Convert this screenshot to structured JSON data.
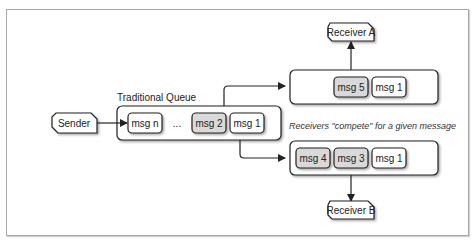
{
  "diagram": {
    "title_queue": "Traditional Queue",
    "caption": "Receivers \"compete\" for a given message",
    "sender": "Sender",
    "receiver_a": "Receiver A",
    "receiver_b": "Receiver B",
    "ellipsis": "...",
    "queue_messages": [
      {
        "label": "msg n",
        "shaded": false
      },
      {
        "label": "msg 2",
        "shaded": true
      },
      {
        "label": "msg 1",
        "shaded": false
      }
    ],
    "receiver_a_messages": [
      {
        "label": "msg 5",
        "shaded": true
      },
      {
        "label": "msg 1",
        "shaded": false
      }
    ],
    "receiver_b_messages": [
      {
        "label": "msg 4",
        "shaded": true
      },
      {
        "label": "msg 3",
        "shaded": true
      },
      {
        "label": "msg 1",
        "shaded": false
      }
    ],
    "colors": {
      "stroke": "#222222",
      "shaded_fill": "#d9d9d9",
      "plain_fill": "#ffffff",
      "frame": "#a8a8a8"
    }
  }
}
